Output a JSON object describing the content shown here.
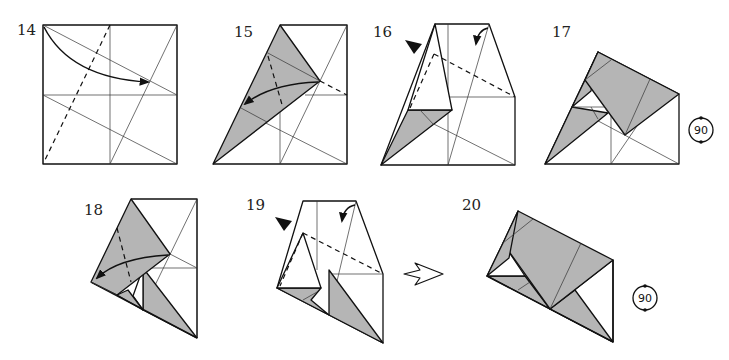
{
  "diagram": {
    "type": "origami folding instructions",
    "steps": [
      {
        "number": "14",
        "instruction": "valley fold corner to crease intersection"
      },
      {
        "number": "15",
        "instruction": "valley fold flap back"
      },
      {
        "number": "16",
        "instruction": "inside reverse fold"
      },
      {
        "number": "17",
        "instruction": "turn over / rotate 90"
      },
      {
        "number": "18",
        "instruction": "valley fold flap"
      },
      {
        "number": "19",
        "instruction": "inside reverse fold"
      },
      {
        "number": "20",
        "instruction": "rotate 90"
      }
    ],
    "rotation_symbols": [
      {
        "label": "90",
        "step": "17"
      },
      {
        "label": "90",
        "step": "20"
      }
    ],
    "colors": {
      "paper_back": "#b5b5b5",
      "paper_front": "#ffffff",
      "lines": "#111111"
    }
  }
}
